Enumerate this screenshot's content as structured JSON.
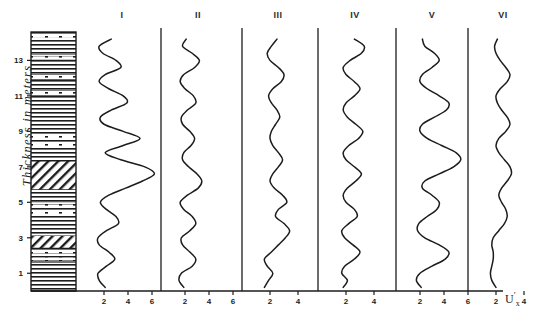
{
  "figure": {
    "type": "stratigraphic-log-with-curves",
    "background_color": "#ffffff",
    "line_color": "#1c1c1c"
  },
  "y_axis": {
    "label": "Thickness in meters",
    "unit": "meters",
    "ticks": [
      1,
      3,
      5,
      7,
      9,
      11,
      13
    ],
    "tick_labels": [
      "1",
      "3",
      "5",
      "7",
      "9",
      "11",
      "13"
    ],
    "range": [
      0,
      14.6
    ]
  },
  "x_axis": {
    "unit_label": "U",
    "unit_prime": "′",
    "unit_subscript": "x",
    "unit_label_full": "U′x"
  },
  "lithology_column": {
    "name": "stratigraphic-column",
    "header": "",
    "patterns": {
      "shale": "horizontal-lines",
      "marl": "horizontal-lines-with-dashes",
      "sandstone": "diagonal-hatch"
    },
    "beds": [
      {
        "top_m": 14.6,
        "base_m": 14.1,
        "pattern": "marl"
      },
      {
        "top_m": 14.1,
        "base_m": 13.3,
        "pattern": "shale"
      },
      {
        "top_m": 13.3,
        "base_m": 13.0,
        "pattern": "marl"
      },
      {
        "top_m": 13.0,
        "base_m": 12.2,
        "pattern": "shale"
      },
      {
        "top_m": 12.2,
        "base_m": 11.9,
        "pattern": "marl"
      },
      {
        "top_m": 11.9,
        "base_m": 11.3,
        "pattern": "shale"
      },
      {
        "top_m": 11.3,
        "base_m": 11.0,
        "pattern": "marl"
      },
      {
        "top_m": 11.0,
        "base_m": 8.9,
        "pattern": "shale"
      },
      {
        "top_m": 8.9,
        "base_m": 8.0,
        "pattern": "marl"
      },
      {
        "top_m": 8.0,
        "base_m": 7.3,
        "pattern": "shale"
      },
      {
        "top_m": 7.3,
        "base_m": 5.7,
        "pattern": "sandstone"
      },
      {
        "top_m": 5.7,
        "base_m": 5.0,
        "pattern": "shale"
      },
      {
        "top_m": 5.0,
        "base_m": 4.2,
        "pattern": "marl"
      },
      {
        "top_m": 4.2,
        "base_m": 3.1,
        "pattern": "shale"
      },
      {
        "top_m": 3.1,
        "base_m": 2.4,
        "pattern": "sandstone"
      },
      {
        "top_m": 2.4,
        "base_m": 1.6,
        "pattern": "marl"
      },
      {
        "top_m": 1.6,
        "base_m": 0.0,
        "pattern": "shale"
      }
    ]
  },
  "chart_data": {
    "type": "line",
    "title": "",
    "xlabel": "U′x",
    "ylabel": "Thickness in meters",
    "grid": false,
    "legend": "none",
    "orientation": "vertical-profile",
    "y": [
      0.2,
      0.6,
      1.0,
      1.4,
      1.8,
      2.2,
      2.6,
      3.0,
      3.4,
      3.8,
      4.2,
      4.6,
      5.0,
      5.4,
      5.8,
      6.2,
      6.6,
      7.0,
      7.4,
      7.8,
      8.2,
      8.6,
      9.0,
      9.4,
      9.8,
      10.2,
      10.6,
      11.0,
      11.4,
      11.8,
      12.2,
      12.6,
      13.0,
      13.4,
      13.8,
      14.2
    ],
    "panels": [
      {
        "label": "I",
        "xlim": [
          0,
          8.4
        ],
        "xticks": [
          2,
          4,
          6
        ],
        "xtick_labels": [
          "2",
          "4",
          "6"
        ],
        "values": [
          2.1,
          1.6,
          1.5,
          2.2,
          2.9,
          2.4,
          1.6,
          1.5,
          2.2,
          3.2,
          3.0,
          2.2,
          1.7,
          2.4,
          3.8,
          5.2,
          6.2,
          5.4,
          3.4,
          2.1,
          3.6,
          5.0,
          3.6,
          2.0,
          1.7,
          2.6,
          3.9,
          3.6,
          2.4,
          1.6,
          2.1,
          3.4,
          3.0,
          1.9,
          1.6,
          2.6
        ]
      },
      {
        "label": "II",
        "xlim": [
          0,
          8.4
        ],
        "xticks": [
          2,
          4,
          6
        ],
        "xtick_labels": [
          "2",
          "4",
          "6"
        ],
        "values": [
          1.9,
          1.5,
          1.7,
          2.6,
          2.9,
          2.4,
          1.8,
          1.7,
          2.4,
          2.9,
          2.6,
          1.9,
          1.6,
          2.2,
          3.1,
          3.4,
          3.0,
          2.3,
          1.8,
          1.9,
          2.5,
          2.8,
          2.4,
          1.8,
          1.7,
          2.2,
          2.9,
          2.7,
          2.0,
          1.6,
          1.9,
          2.8,
          3.2,
          2.6,
          1.8,
          2.1
        ]
      },
      {
        "label": "III",
        "xlim": [
          0,
          5.6
        ],
        "xticks": [
          2,
          4
        ],
        "xtick_labels": [
          "2",
          "4"
        ],
        "values": [
          1.6,
          1.9,
          2.2,
          1.8,
          1.6,
          2.1,
          2.6,
          3.1,
          3.4,
          3.0,
          2.4,
          2.6,
          3.2,
          2.9,
          2.3,
          2.0,
          2.2,
          2.6,
          2.9,
          2.6,
          2.2,
          2.0,
          2.1,
          2.4,
          2.7,
          2.5,
          2.1,
          1.9,
          2.2,
          2.8,
          3.0,
          2.6,
          2.0,
          1.8,
          2.1,
          2.5
        ]
      },
      {
        "label": "IV",
        "xlim": [
          0,
          5.6
        ],
        "xticks": [
          2,
          4
        ],
        "xtick_labels": [
          "2",
          "4"
        ],
        "values": [
          1.8,
          2.1,
          1.7,
          1.9,
          2.6,
          3.0,
          2.5,
          1.9,
          1.7,
          2.2,
          2.8,
          2.6,
          2.0,
          1.8,
          2.1,
          2.7,
          3.1,
          2.6,
          2.0,
          1.8,
          2.2,
          2.9,
          3.2,
          2.7,
          2.1,
          1.8,
          2.0,
          2.6,
          3.0,
          2.6,
          2.0,
          1.8,
          2.3,
          3.1,
          3.3,
          2.6
        ]
      },
      {
        "label": "V",
        "xlim": [
          0,
          8.4
        ],
        "xticks": [
          2,
          4,
          6
        ],
        "xtick_labels": [
          "2",
          "4",
          "6"
        ],
        "values": [
          2.1,
          1.7,
          2.0,
          3.0,
          4.1,
          4.4,
          3.6,
          2.4,
          1.8,
          1.9,
          2.6,
          3.4,
          3.6,
          3.0,
          2.2,
          2.4,
          3.6,
          4.8,
          5.4,
          5.0,
          3.8,
          2.6,
          2.0,
          2.2,
          3.2,
          4.2,
          4.4,
          3.6,
          2.6,
          2.0,
          2.2,
          3.0,
          3.6,
          3.2,
          2.4,
          2.2
        ]
      },
      {
        "label": "VI",
        "xlim": [
          0,
          5.6
        ],
        "xticks": [
          2,
          4
        ],
        "xtick_labels": [
          "2",
          "4"
        ],
        "values": [
          2.0,
          1.7,
          1.6,
          1.7,
          1.8,
          1.8,
          1.7,
          1.8,
          2.2,
          2.6,
          2.8,
          2.7,
          2.4,
          2.2,
          2.4,
          2.8,
          3.1,
          3.0,
          2.6,
          2.2,
          2.0,
          2.2,
          2.7,
          3.0,
          2.8,
          2.4,
          2.1,
          2.0,
          2.3,
          2.8,
          3.0,
          2.7,
          2.3,
          2.0,
          1.9,
          2.1
        ]
      }
    ]
  },
  "panel_titles": [
    "I",
    "II",
    "III",
    "IV",
    "V",
    "VI"
  ]
}
